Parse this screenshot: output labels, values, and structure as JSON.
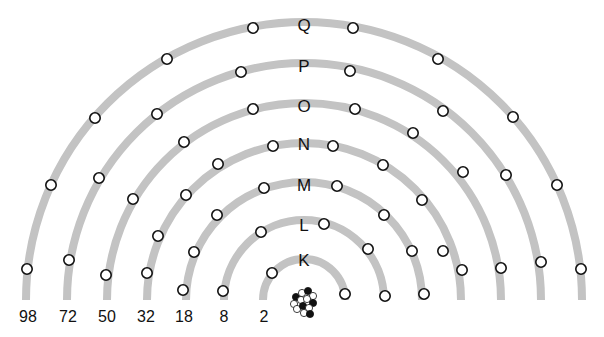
{
  "diagram": {
    "type": "electron-shell-model",
    "center": {
      "x": 304,
      "y": 300
    },
    "colors": {
      "shell": "#c3c3c3",
      "electron_fill": "#ffffff",
      "electron_stroke": "#111111",
      "text": "#111111",
      "proton": "#111111",
      "neutron": "#ffffff"
    },
    "shells": [
      {
        "label": "K",
        "radius": 41,
        "label_y": 260,
        "capacity": "2",
        "capacity_x": 264,
        "electrons": [
          [
            272,
            273
          ],
          [
            345,
            294
          ]
        ]
      },
      {
        "label": "L",
        "radius": 80,
        "label_y": 225,
        "capacity": "8",
        "capacity_x": 224,
        "electrons": [
          [
            261,
            232
          ],
          [
            324,
            224
          ],
          [
            368,
            249
          ],
          [
            385,
            296
          ],
          [
            223,
            291
          ]
        ]
      },
      {
        "label": "M",
        "radius": 118,
        "label_y": 185,
        "capacity": "18",
        "capacity_x": 184,
        "electrons": [
          [
            194,
            252
          ],
          [
            217,
            215
          ],
          [
            264,
            188
          ],
          [
            337,
            186
          ],
          [
            384,
            215
          ],
          [
            412,
            251
          ],
          [
            424,
            294
          ],
          [
            183,
            290
          ]
        ]
      },
      {
        "label": "N",
        "radius": 157,
        "label_y": 144,
        "capacity": "32",
        "capacity_x": 146,
        "electrons": [
          [
            147,
            273
          ],
          [
            158,
            236
          ],
          [
            186,
            195
          ],
          [
            218,
            164
          ],
          [
            273,
            146
          ],
          [
            333,
            146
          ],
          [
            383,
            165
          ],
          [
            422,
            200
          ],
          [
            443,
            251
          ],
          [
            462,
            270
          ]
        ]
      },
      {
        "label": "O",
        "radius": 197,
        "label_y": 106,
        "capacity": "50",
        "capacity_x": 107,
        "electrons": [
          [
            106,
            275
          ],
          [
            133,
            199
          ],
          [
            184,
            142
          ],
          [
            253,
            109
          ],
          [
            355,
            109
          ],
          [
            413,
            133
          ],
          [
            463,
            172
          ],
          [
            501,
            268
          ]
        ]
      },
      {
        "label": "P",
        "radius": 237,
        "label_y": 66,
        "capacity": "72",
        "capacity_x": 68,
        "electrons": [
          [
            69,
            260
          ],
          [
            99,
            178
          ],
          [
            157,
            114
          ],
          [
            241,
            72
          ],
          [
            350,
            71
          ],
          [
            443,
            111
          ],
          [
            506,
            175
          ],
          [
            541,
            262
          ]
        ]
      },
      {
        "label": "Q",
        "radius": 278,
        "label_y": 25,
        "capacity": "98",
        "capacity_x": 28,
        "electrons": [
          [
            27,
            269
          ],
          [
            51,
            185
          ],
          [
            95,
            118
          ],
          [
            167,
            59
          ],
          [
            253,
            28
          ],
          [
            353,
            28
          ],
          [
            438,
            59
          ],
          [
            513,
            117
          ],
          [
            557,
            185
          ],
          [
            581,
            269
          ]
        ]
      }
    ],
    "capacity_label_y": 322,
    "nucleus": {
      "x": 304,
      "y": 302,
      "nucleons": [
        {
          "dx": -8,
          "dy": -5,
          "type": "proton"
        },
        {
          "dx": -2,
          "dy": -9,
          "type": "neutron"
        },
        {
          "dx": 4,
          "dy": -11,
          "type": "proton"
        },
        {
          "dx": 9,
          "dy": -6,
          "type": "neutron"
        },
        {
          "dx": -10,
          "dy": 2,
          "type": "neutron"
        },
        {
          "dx": -3,
          "dy": -2,
          "type": "neutron"
        },
        {
          "dx": 3,
          "dy": -3,
          "type": "neutron"
        },
        {
          "dx": 9,
          "dy": 1,
          "type": "proton"
        },
        {
          "dx": -7,
          "dy": 7,
          "type": "neutron"
        },
        {
          "dx": -1,
          "dy": 4,
          "type": "proton"
        },
        {
          "dx": 5,
          "dy": 6,
          "type": "neutron"
        },
        {
          "dx": 0,
          "dy": 11,
          "type": "neutron"
        },
        {
          "dx": 6,
          "dy": 12,
          "type": "proton"
        }
      ]
    }
  }
}
